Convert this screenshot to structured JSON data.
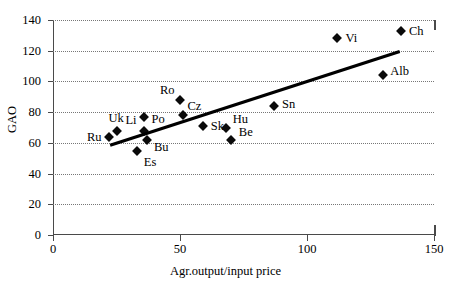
{
  "chart_data": {
    "type": "scatter",
    "title": "",
    "xlabel": "Agr.output/input price",
    "ylabel": "GAO",
    "xlim": [
      0,
      150
    ],
    "ylim": [
      0,
      140
    ],
    "xticks": [
      0,
      50,
      100,
      150
    ],
    "yticks": [
      0,
      20,
      40,
      60,
      80,
      100,
      120,
      140
    ],
    "grid": "horizontal-dotted",
    "legend": "none",
    "points": [
      {
        "label": "Ru",
        "x": 22,
        "y": 64,
        "label_dx": -22,
        "label_dy": 0
      },
      {
        "label": "Uk",
        "x": 25,
        "y": 68,
        "label_dx": -8,
        "label_dy": -13
      },
      {
        "label": "Es",
        "x": 33,
        "y": 55,
        "label_dx": 7,
        "label_dy": 11
      },
      {
        "label": "Li",
        "x": 36,
        "y": 68,
        "label_dx": -19,
        "label_dy": -11
      },
      {
        "label": "Bu",
        "x": 37,
        "y": 62,
        "label_dx": 7,
        "label_dy": 7
      },
      {
        "label": "Po",
        "x": 36,
        "y": 77,
        "label_dx": 7,
        "label_dy": 2
      },
      {
        "label": "Ro",
        "x": 50,
        "y": 88,
        "label_dx": -20,
        "label_dy": -10
      },
      {
        "label": "Cz",
        "x": 51,
        "y": 78,
        "label_dx": 5,
        "label_dy": -9
      },
      {
        "label": "Sk",
        "x": 59,
        "y": 71,
        "label_dx": 8,
        "label_dy": 0
      },
      {
        "label": "Hu",
        "x": 68,
        "y": 70,
        "label_dx": 7,
        "label_dy": -9
      },
      {
        "label": "Be",
        "x": 70,
        "y": 62,
        "label_dx": 8,
        "label_dy": -8
      },
      {
        "label": "Sn",
        "x": 87,
        "y": 84,
        "label_dx": 8,
        "label_dy": -2
      },
      {
        "label": "Vi",
        "x": 112,
        "y": 128,
        "label_dx": 8,
        "label_dy": 0
      },
      {
        "label": "Ch",
        "x": 137,
        "y": 133,
        "label_dx": 8,
        "label_dy": 0
      },
      {
        "label": "Alb",
        "x": 130,
        "y": 104,
        "label_dx": 7,
        "label_dy": -4
      }
    ],
    "trendline": {
      "x_start": 22.5,
      "y_start": 58.5,
      "x_end": 136.5,
      "y_end": 119.5
    }
  },
  "colors": {
    "marker": "#0a0a0a",
    "axis": "#4a4a4a",
    "grid": "#777777",
    "trend": "#000000",
    "background": "#ffffff"
  }
}
